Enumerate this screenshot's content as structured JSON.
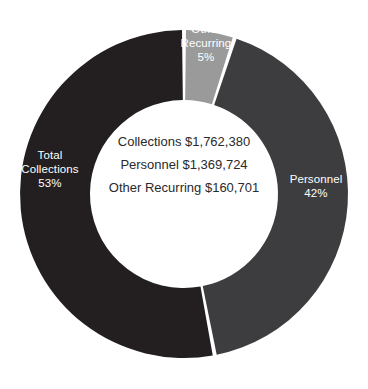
{
  "chart_data": {
    "type": "pie",
    "variant": "donut",
    "title": "",
    "subtitle": "",
    "xlabel": "",
    "ylabel": "",
    "legend_position": "none",
    "grid": false,
    "start_angle_deg": 0,
    "direction": "clockwise",
    "inner_radius_ratio": 0.573,
    "background_color": "#ffffff",
    "categories": [
      "Other Recurring",
      "Personnel",
      "Total Collections"
    ],
    "values": [
      5,
      42,
      53
    ],
    "value_unit": "percent",
    "amounts": [
      160701,
      1369724,
      1762380
    ],
    "colors": [
      "#9a9a9a",
      "#3d3d3f",
      "#231f20"
    ],
    "slices": [
      {
        "name": "Other Recurring",
        "percent": 5,
        "percent_label": "5%",
        "amount": 160701,
        "amount_label": "$160,701",
        "color": "#9a9a9a",
        "label_text": "Other\nRecurring\n5%",
        "label_color": "#ffffff"
      },
      {
        "name": "Personnel",
        "percent": 42,
        "percent_label": "42%",
        "amount": 1369724,
        "amount_label": "$1,369,724",
        "color": "#3d3d3f",
        "label_text": "Personnel\n42%",
        "label_color": "#ffffff"
      },
      {
        "name": "Total Collections",
        "percent": 53,
        "percent_label": "53%",
        "amount": 1762380,
        "amount_label": "$1,762,380",
        "color": "#231f20",
        "label_text": "Total\nCollections\n53%",
        "label_color": "#ffffff"
      }
    ],
    "annotations": [
      "Collections $1,762,380",
      "Personnel $1,369,724",
      "Other Recurring $160,701"
    ]
  },
  "center": {
    "line1": "Collections $1,762,380",
    "line2": "Personnel $1,369,724",
    "line3": "Other Recurring $160,701"
  },
  "labels": {
    "total_collections": "Total\nCollections\n53%",
    "personnel": "Personnel\n42%",
    "other_recurring": "Other\nRecurring\n5%"
  }
}
